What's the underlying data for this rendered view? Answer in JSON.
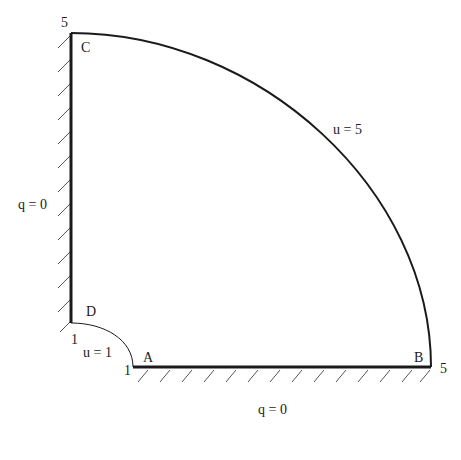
{
  "diagram": {
    "type": "quarter-annulus boundary value problem",
    "corners": {
      "A": {
        "label": "A",
        "coord_label": "1"
      },
      "B": {
        "label": "B",
        "coord_label": "5"
      },
      "C": {
        "label": "C",
        "coord_label": "5"
      },
      "D": {
        "label": "D",
        "coord_label": "1"
      }
    },
    "boundaries": {
      "outer_arc": {
        "label": "u = 5",
        "from": "B",
        "to": "C"
      },
      "inner_arc": {
        "label": "u = 1",
        "from": "D",
        "to": "A"
      },
      "left_wall": {
        "label": "q = 0",
        "from": "D",
        "to": "C",
        "hatched": true
      },
      "bottom_wall": {
        "label": "q = 0",
        "from": "A",
        "to": "B",
        "hatched": true
      }
    },
    "geometry": {
      "inner_radius": 1,
      "outer_radius": 5
    },
    "colors": {
      "line": "#1a1a1a",
      "hatch": "#555555",
      "background": "#ffffff"
    }
  }
}
